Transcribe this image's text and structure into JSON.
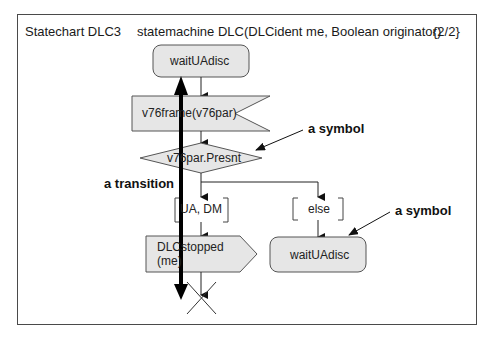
{
  "header": {
    "diagram_name": "Statechart DLC3",
    "signature": "statemachine DLC(DLCident me, Boolean originator)",
    "page": "{2/2}"
  },
  "symbols": {
    "state_top": "waitUAdisc",
    "input_signal": "v76frame(v76par)",
    "decision": "v76par.Presnt",
    "answer_left": "UA, DM",
    "answer_right": "else",
    "output_line1": "DLCstopped",
    "output_line2": "(me)",
    "state_right": "waitUAdisc"
  },
  "annotations": {
    "symbol_upper": "a symbol",
    "symbol_lower": "a symbol",
    "transition": "a transition"
  },
  "colors": {
    "symbol_fill": "#e6e6e6",
    "symbol_stroke": "#555555",
    "arrow": "#000000"
  }
}
